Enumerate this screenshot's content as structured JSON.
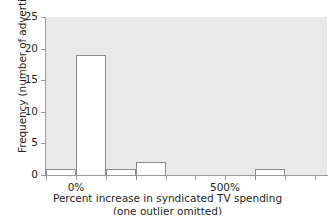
{
  "chart_data": {
    "type": "bar",
    "title": "",
    "subtitle": "",
    "xlabel": "Percent increase in syndicated TV spending",
    "xlabel_line2": "(one outlier omitted)",
    "ylabel": "Frequency (number of advertisers)",
    "grid": false,
    "legend": "none",
    "bin_width_percent": 100,
    "xlim": [
      -100,
      840
    ],
    "ylim": [
      0,
      25
    ],
    "yticks": [
      0,
      5,
      10,
      15,
      20,
      25
    ],
    "ytick_labels": [
      "0",
      "5",
      "10",
      "15",
      "20",
      "25"
    ],
    "xticks": [
      -100,
      0,
      100,
      200,
      300,
      400,
      500,
      600,
      700,
      800
    ],
    "xtick_labels": [
      "",
      "0%",
      "",
      "",
      "",
      "",
      "500%",
      "",
      "",
      ""
    ],
    "labeled_xticks": [
      {
        "value": 0,
        "label": "0%"
      },
      {
        "value": 500,
        "label": "500%"
      }
    ],
    "categories": [
      "-100%",
      "0%",
      "100%",
      "200%",
      "300%",
      "400%",
      "500%",
      "600%",
      "700%"
    ],
    "bin_starts": [
      -100,
      0,
      100,
      200,
      300,
      400,
      500,
      600,
      700
    ],
    "values": [
      1,
      19,
      1,
      2,
      0,
      0,
      0,
      1,
      0
    ],
    "bars": [
      {
        "bin_start": -100,
        "bin_end": 0,
        "value": 1
      },
      {
        "bin_start": 0,
        "bin_end": 100,
        "value": 19
      },
      {
        "bin_start": 100,
        "bin_end": 200,
        "value": 1
      },
      {
        "bin_start": 200,
        "bin_end": 300,
        "value": 2
      },
      {
        "bin_start": 600,
        "bin_end": 700,
        "value": 1
      }
    ],
    "colors": {
      "plot_background": "#e9e9e9",
      "bar_fill": "#ffffff",
      "bar_edge": "#8c8c8c",
      "axis": "#9a9a9a",
      "text": "#231f20",
      "figure_background": "#ffffff"
    }
  }
}
